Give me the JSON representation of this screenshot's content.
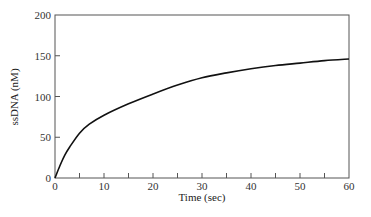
{
  "chart_data": {
    "type": "line",
    "title": "",
    "xlabel": "Time (sec)",
    "ylabel": "ssDNA (nM)",
    "xlim": [
      0,
      60
    ],
    "ylim": [
      0,
      200
    ],
    "xticks": [
      0,
      10,
      20,
      30,
      40,
      50,
      60
    ],
    "xminor_ticks": [
      5,
      15,
      25,
      35,
      45,
      55
    ],
    "yticks": [
      0,
      50,
      100,
      150,
      200
    ],
    "grid": false,
    "legend": null,
    "series": [
      {
        "name": "ssDNA",
        "color": "#111111",
        "x": [
          0,
          1,
          2,
          3,
          5,
          7,
          10,
          15,
          20,
          25,
          30,
          35,
          40,
          45,
          50,
          55,
          60
        ],
        "values": [
          0,
          15,
          28,
          38,
          55,
          66,
          77,
          91,
          103,
          114,
          123,
          129,
          134,
          138,
          141,
          144,
          146
        ]
      }
    ]
  },
  "colors": {
    "frame": "#555555",
    "curve": "#111111",
    "background": "#ffffff"
  }
}
